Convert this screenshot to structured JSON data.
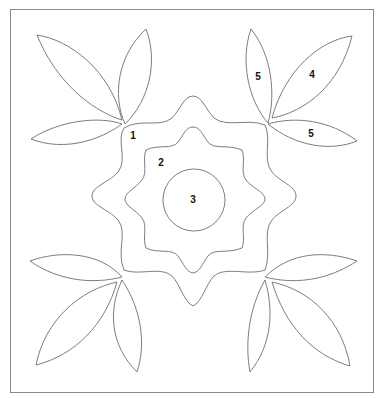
{
  "diagram": {
    "type": "quilt-applique-pattern",
    "colors": {
      "line": "#6e6e6e",
      "frame": "#8a8a8a",
      "label": "#111111",
      "background": "#ffffff"
    },
    "labels": [
      {
        "id": "region-1",
        "text": "1",
        "x": 133,
        "y": 139
      },
      {
        "id": "region-2",
        "text": "2",
        "x": 161,
        "y": 166
      },
      {
        "id": "region-3",
        "text": "3",
        "x": 193,
        "y": 203
      },
      {
        "id": "region-5-top",
        "text": "5",
        "x": 258,
        "y": 80
      },
      {
        "id": "region-4",
        "text": "4",
        "x": 312,
        "y": 78
      },
      {
        "id": "region-5-side",
        "text": "5",
        "x": 311,
        "y": 137
      }
    ]
  }
}
